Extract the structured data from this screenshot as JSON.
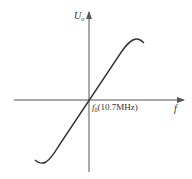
{
  "diagram": {
    "type": "frequency discriminator characteristic curve (S-curve)",
    "y_axis": {
      "label": "U",
      "subscript": "o"
    },
    "x_axis": {
      "label": "f"
    },
    "center_label": {
      "symbol": "f",
      "subscript": "0",
      "value": "(10.7MHz)"
    },
    "colors": {
      "line": "#333333",
      "axis": "#555555",
      "background": "#ffffff"
    }
  }
}
